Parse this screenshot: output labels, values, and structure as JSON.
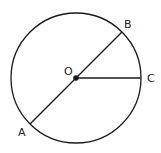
{
  "diagram": {
    "type": "circle-geometry",
    "center": {
      "label": "O"
    },
    "points": [
      {
        "id": "A",
        "label": "A",
        "angle_deg": 225
      },
      {
        "id": "B",
        "label": "B",
        "angle_deg": 45
      },
      {
        "id": "C",
        "label": "C",
        "angle_deg": 0
      }
    ],
    "segments": [
      {
        "id": "AB",
        "from": "A",
        "to": "B",
        "kind": "diameter"
      },
      {
        "id": "OC",
        "from": "O",
        "to": "C",
        "kind": "radius"
      }
    ],
    "colors": {
      "line": "#1a1a1a",
      "text": "#222222",
      "background": "#ffffff"
    }
  }
}
